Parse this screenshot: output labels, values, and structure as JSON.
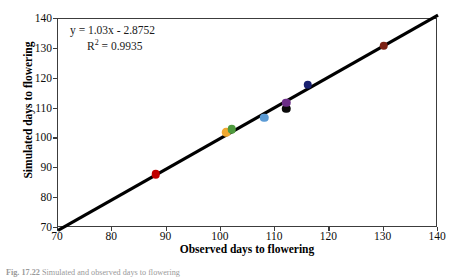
{
  "figure": {
    "caption_label": "Fig. 17.22",
    "caption_text": "Simulated and observed days to flowering"
  },
  "annotation": {
    "equation": "y = 1.03x - 2.8752",
    "r_squared_prefix": "R",
    "r_squared_sup": "2",
    "r_squared_value": " = 0.9935"
  },
  "chart_data": {
    "type": "scatter",
    "title": "",
    "xlabel": "Observed days to flowering",
    "ylabel": "Simulated days to flowering",
    "xlim": [
      70,
      140
    ],
    "ylim": [
      70,
      140
    ],
    "xticks": [
      70,
      80,
      90,
      100,
      110,
      120,
      130,
      140
    ],
    "yticks": [
      70,
      80,
      90,
      100,
      110,
      120,
      130,
      140
    ],
    "grid": false,
    "legend": "none",
    "fit": {
      "equation": "y = 1.03x - 2.8752",
      "slope": 1.03,
      "intercept": -2.8752,
      "r_squared": 0.9935,
      "line_x": [
        70,
        140
      ],
      "line_y": [
        69.2,
        141.3
      ],
      "color": "#000000"
    },
    "points": [
      {
        "name": "point-red",
        "x": 88,
        "y": 88,
        "color": "#C00000"
      },
      {
        "name": "point-orange",
        "x": 101,
        "y": 102,
        "color": "#F0A830"
      },
      {
        "name": "point-green",
        "x": 102,
        "y": 103,
        "color": "#4E9A3E"
      },
      {
        "name": "point-lightblue",
        "x": 108,
        "y": 107,
        "color": "#5B9BD5"
      },
      {
        "name": "point-black",
        "x": 112,
        "y": 110,
        "color": "#0A0A0A"
      },
      {
        "name": "point-purple",
        "x": 112,
        "y": 112,
        "color": "#6B2D86"
      },
      {
        "name": "point-navy",
        "x": 116,
        "y": 118,
        "color": "#18206F"
      },
      {
        "name": "point-darkred",
        "x": 130,
        "y": 131,
        "color": "#7B2113"
      }
    ]
  }
}
